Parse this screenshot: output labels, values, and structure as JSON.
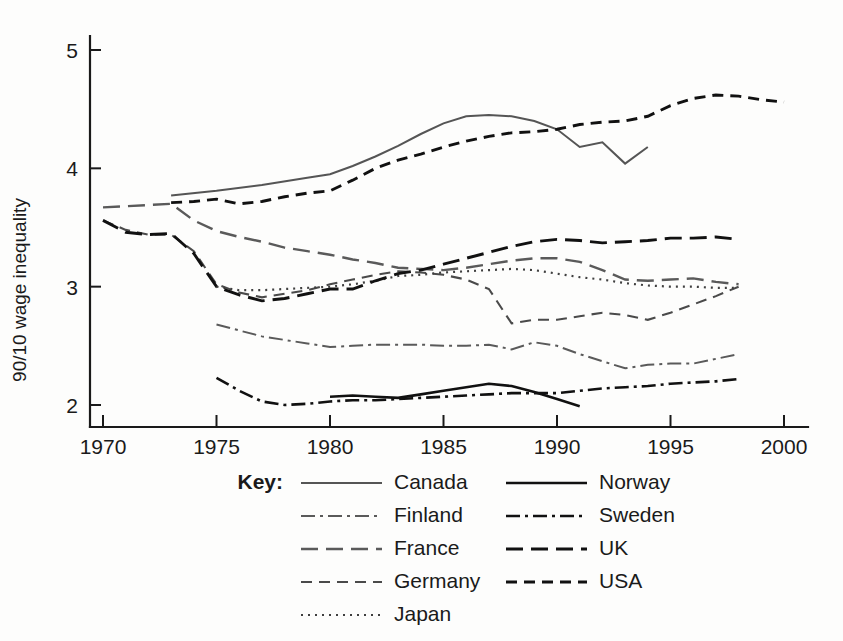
{
  "chart_data": {
    "type": "line",
    "title": "",
    "xlabel": "",
    "ylabel": "90/10 wage inequality",
    "xlim": [
      1968.5,
      2002.5
    ],
    "ylim": [
      1.82,
      5.25
    ],
    "xticks": [
      1970,
      1975,
      1980,
      1985,
      1990,
      1995,
      2000
    ],
    "xtick_labels": [
      "1970",
      "1975",
      "1980",
      "1985",
      "1990",
      "1995",
      "2000"
    ],
    "yticks": [
      2,
      3,
      4,
      5
    ],
    "ytick_labels": [
      "2",
      "3",
      "4",
      "5"
    ],
    "grid": false,
    "legend_position": "below",
    "legend_title": "Key:",
    "series": [
      {
        "name": "Canada",
        "style": "solid",
        "color": "#555555",
        "width": 2.0,
        "dash": "none",
        "x": [
          1973,
          1975,
          1977,
          1979,
          1980,
          1981,
          1982,
          1983,
          1984,
          1985,
          1986,
          1987,
          1988,
          1989,
          1990,
          1991,
          1992,
          1993,
          1994
        ],
        "y": [
          3.77,
          3.81,
          3.86,
          3.92,
          3.95,
          4.02,
          4.1,
          4.19,
          4.29,
          4.38,
          4.44,
          4.45,
          4.44,
          4.4,
          4.33,
          4.18,
          4.22,
          4.04,
          4.18
        ]
      },
      {
        "name": "Finland",
        "style": "dash-dot",
        "color": "#5a5a5a",
        "width": 2.0,
        "dash": "14,5,3,5",
        "x": [
          1975,
          1977,
          1979,
          1980,
          1981,
          1982,
          1983,
          1984,
          1985,
          1986,
          1987,
          1988,
          1989,
          1990,
          1991,
          1992,
          1993,
          1994,
          1995,
          1996,
          1997,
          1998
        ],
        "y": [
          2.68,
          2.58,
          2.52,
          2.49,
          2.5,
          2.51,
          2.51,
          2.51,
          2.5,
          2.5,
          2.51,
          2.47,
          2.53,
          2.5,
          2.43,
          2.37,
          2.31,
          2.34,
          2.35,
          2.35,
          2.39,
          2.43
        ]
      },
      {
        "name": "France",
        "style": "long-dash",
        "color": "#5a5a5a",
        "width": 2.4,
        "dash": "17,8",
        "x": [
          1970,
          1971,
          1972,
          1973,
          1974,
          1975,
          1976,
          1977,
          1978,
          1979,
          1980,
          1981,
          1982,
          1983,
          1984,
          1985,
          1986,
          1987,
          1988,
          1989,
          1990,
          1991,
          1992,
          1993,
          1994,
          1995,
          1996,
          1997,
          1998
        ],
        "y": [
          3.67,
          3.68,
          3.69,
          3.7,
          3.56,
          3.47,
          3.42,
          3.38,
          3.33,
          3.3,
          3.27,
          3.23,
          3.2,
          3.16,
          3.15,
          3.14,
          3.16,
          3.19,
          3.22,
          3.24,
          3.24,
          3.21,
          3.14,
          3.06,
          3.05,
          3.06,
          3.07,
          3.04,
          3.02
        ]
      },
      {
        "name": "Germany",
        "style": "dash",
        "color": "#4a4a4a",
        "width": 2.1,
        "dash": "11,7",
        "x": [
          1970,
          1971,
          1972,
          1973,
          1974,
          1975,
          1976,
          1977,
          1978,
          1979,
          1980,
          1981,
          1982,
          1983,
          1984,
          1985,
          1986,
          1987,
          1988,
          1989,
          1990,
          1991,
          1992,
          1993,
          1994,
          1995,
          1996,
          1997,
          1998
        ],
        "y": [
          3.56,
          3.48,
          3.44,
          3.44,
          3.3,
          3.02,
          2.95,
          2.91,
          2.94,
          2.97,
          3.02,
          3.06,
          3.1,
          3.13,
          3.12,
          3.1,
          3.06,
          2.98,
          2.69,
          2.72,
          2.72,
          2.75,
          2.78,
          2.76,
          2.72,
          2.78,
          2.85,
          2.92,
          3.0
        ]
      },
      {
        "name": "Japan",
        "style": "dotted",
        "color": "#3f3f3f",
        "width": 2.2,
        "dash": "2,5",
        "x": [
          1975,
          1976,
          1977,
          1978,
          1979,
          1980,
          1981,
          1982,
          1983,
          1984,
          1985,
          1986,
          1987,
          1988,
          1989,
          1990,
          1991,
          1992,
          1993,
          1994,
          1995,
          1996,
          1997,
          1998
        ],
        "y": [
          3.0,
          2.97,
          2.97,
          2.98,
          2.99,
          3.0,
          3.02,
          3.05,
          3.09,
          3.1,
          3.12,
          3.13,
          3.14,
          3.15,
          3.14,
          3.11,
          3.08,
          3.06,
          3.03,
          3.01,
          3.0,
          3.0,
          2.99,
          2.99
        ]
      },
      {
        "name": "Norway",
        "style": "solid",
        "color": "#111111",
        "width": 2.6,
        "dash": "none",
        "x": [
          1980,
          1981,
          1982,
          1983,
          1984,
          1985,
          1986,
          1987,
          1988,
          1989,
          1990,
          1991
        ],
        "y": [
          2.07,
          2.08,
          2.07,
          2.06,
          2.09,
          2.12,
          2.15,
          2.18,
          2.16,
          2.11,
          2.05,
          1.99
        ]
      },
      {
        "name": "Sweden",
        "style": "dash-dot",
        "color": "#111111",
        "width": 2.6,
        "dash": "14,5,3,5",
        "x": [
          1975,
          1976,
          1977,
          1978,
          1979,
          1980,
          1981,
          1982,
          1983,
          1984,
          1985,
          1986,
          1987,
          1988,
          1989,
          1990,
          1991,
          1992,
          1993,
          1994,
          1995,
          1996,
          1997,
          1998
        ],
        "y": [
          2.23,
          2.12,
          2.03,
          2.0,
          2.01,
          2.03,
          2.04,
          2.04,
          2.05,
          2.06,
          2.07,
          2.08,
          2.09,
          2.1,
          2.1,
          2.1,
          2.12,
          2.14,
          2.15,
          2.16,
          2.18,
          2.19,
          2.2,
          2.22
        ]
      },
      {
        "name": "UK",
        "style": "long-dash",
        "color": "#111111",
        "width": 2.9,
        "dash": "17,8",
        "x": [
          1970,
          1971,
          1972,
          1973,
          1974,
          1975,
          1976,
          1977,
          1978,
          1979,
          1980,
          1981,
          1982,
          1983,
          1984,
          1985,
          1986,
          1987,
          1988,
          1989,
          1990,
          1991,
          1992,
          1993,
          1994,
          1995,
          1996,
          1997,
          1998
        ],
        "y": [
          3.56,
          3.46,
          3.44,
          3.45,
          3.28,
          3.0,
          2.93,
          2.88,
          2.9,
          2.94,
          2.98,
          2.98,
          3.05,
          3.11,
          3.14,
          3.19,
          3.24,
          3.29,
          3.34,
          3.38,
          3.4,
          3.39,
          3.37,
          3.38,
          3.39,
          3.41,
          3.41,
          3.42,
          3.4
        ]
      },
      {
        "name": "USA",
        "style": "dash",
        "color": "#111111",
        "width": 2.9,
        "dash": "11,7",
        "x": [
          1973,
          1974,
          1975,
          1976,
          1977,
          1978,
          1979,
          1980,
          1981,
          1982,
          1983,
          1984,
          1985,
          1986,
          1987,
          1988,
          1989,
          1990,
          1991,
          1992,
          1993,
          1994,
          1995,
          1996,
          1997,
          1998,
          1999,
          2000
        ],
        "y": [
          3.71,
          3.72,
          3.74,
          3.7,
          3.72,
          3.76,
          3.79,
          3.81,
          3.9,
          4.0,
          4.07,
          4.12,
          4.18,
          4.23,
          4.27,
          4.3,
          4.31,
          4.33,
          4.37,
          4.39,
          4.4,
          4.44,
          4.53,
          4.59,
          4.62,
          4.61,
          4.58,
          4.56
        ]
      }
    ]
  },
  "legend": {
    "key_label": "Key:",
    "column_left": [
      {
        "label": "Canada",
        "series": "Canada"
      },
      {
        "label": "Finland",
        "series": "Finland"
      },
      {
        "label": "France",
        "series": "France"
      },
      {
        "label": "Germany",
        "series": "Germany"
      },
      {
        "label": "Japan",
        "series": "Japan"
      }
    ],
    "column_right": [
      {
        "label": "Norway",
        "series": "Norway"
      },
      {
        "label": "Sweden",
        "series": "Sweden"
      },
      {
        "label": "UK",
        "series": "UK"
      },
      {
        "label": "USA",
        "series": "USA"
      }
    ]
  }
}
